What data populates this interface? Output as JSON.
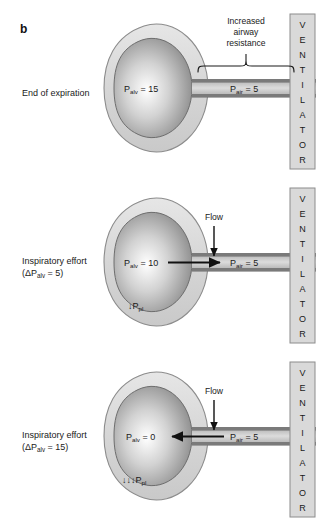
{
  "figure": {
    "letter": "b",
    "ventilator_word": "VENTILATOR",
    "bracket_label": [
      "Increased",
      "airway",
      "resistance"
    ],
    "flow_label": "Flow"
  },
  "colors": {
    "pleura_fill": "#d9d9d9",
    "pleura_stroke": "#8c8c8c",
    "alveolus_light": "#ffffff",
    "alveolus_dark": "#8a8a8a",
    "alveolus_stroke": "#6e6e6e",
    "tube_wall": "#7a7a7a",
    "tube_lumen": "#cfcfcf",
    "ventilator_fill": "#d9d9d9",
    "ventilator_stroke": "#8c8c8c",
    "text": "#1a1a1a"
  },
  "panels": [
    {
      "id": "end-of-expiration",
      "caption_lines": [
        "End of expiration"
      ],
      "p_alv": {
        "symbol": "P",
        "subscript": "alv",
        "value": "15",
        "text": "P_alv = 15"
      },
      "p_air": {
        "symbol": "P",
        "subscript": "air",
        "value": "5",
        "text": "P_air = 5"
      },
      "flow": {
        "present": false,
        "direction": "none"
      },
      "ppl": {
        "present": false,
        "arrows": 0,
        "text": ""
      },
      "bracket": {
        "present": true
      }
    },
    {
      "id": "inspiratory-effort-5",
      "caption_lines": [
        "Inspiratory effort",
        "(ΔP_alv = 5)"
      ],
      "caption_delta": {
        "prefix": "(ΔP",
        "subscript": "alv",
        "suffix": " = 5)"
      },
      "p_alv": {
        "symbol": "P",
        "subscript": "alv",
        "value": "10",
        "text": "P_alv = 10"
      },
      "p_air": {
        "symbol": "P",
        "subscript": "air",
        "value": "5",
        "text": "P_air = 5"
      },
      "flow": {
        "present": true,
        "direction": "right"
      },
      "ppl": {
        "present": true,
        "arrows": 1,
        "text": "↓P_pl"
      },
      "bracket": {
        "present": false
      }
    },
    {
      "id": "inspiratory-effort-15",
      "caption_lines": [
        "Inspiratory effort",
        "(ΔP_alv = 15)"
      ],
      "caption_delta": {
        "prefix": "(ΔP",
        "subscript": "alv",
        "suffix": " = 15)"
      },
      "p_alv": {
        "symbol": "P",
        "subscript": "alv",
        "value": "0",
        "text": "P_alv = 0"
      },
      "p_air": {
        "symbol": "P",
        "subscript": "air",
        "value": "5",
        "text": "P_air = 5"
      },
      "flow": {
        "present": true,
        "direction": "left"
      },
      "ppl": {
        "present": true,
        "arrows": 3,
        "text": "↓↓↓P_pl"
      },
      "bracket": {
        "present": false
      }
    }
  ]
}
